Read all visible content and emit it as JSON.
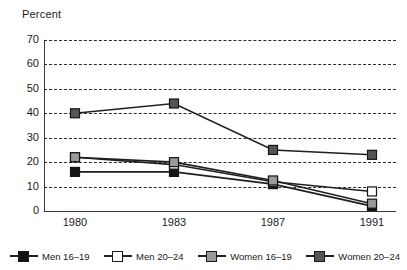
{
  "chart_data": {
    "type": "line",
    "title": "",
    "subtitle": "",
    "xlabel": "",
    "ylabel": "Percent",
    "categories": [
      "1980",
      "1983",
      "1987",
      "1991"
    ],
    "ylim": [
      0,
      70
    ],
    "ytick_step": 10,
    "yticks": [
      "70",
      "60",
      "50",
      "40",
      "30",
      "20",
      "10",
      "0"
    ],
    "grid": "horizontal-dashed",
    "legend_position": "bottom",
    "series": [
      {
        "name": "Men 16–19",
        "marker": "filled-square",
        "color": "#141414",
        "values": [
          16,
          16,
          11,
          2
        ]
      },
      {
        "name": "Men 20–24",
        "marker": "open-square",
        "color": "#ffffff",
        "values": [
          22,
          19,
          12,
          8
        ]
      },
      {
        "name": "Women 16–19",
        "marker": "filled-square",
        "color": "#9a9a9a",
        "values": [
          22,
          20,
          12.5,
          3
        ]
      },
      {
        "name": "Women 20–24",
        "marker": "filled-square",
        "color": "#555555",
        "values": [
          40,
          44,
          25,
          23
        ]
      }
    ]
  },
  "axis": {
    "y_label": "Percent",
    "y_ticks": [
      "70",
      "60",
      "50",
      "40",
      "30",
      "20",
      "10",
      "0"
    ],
    "x_ticks": [
      "1980",
      "1983",
      "1987",
      "1991"
    ]
  },
  "legend": {
    "items": [
      {
        "label": "Men 16–19",
        "swatch": "#141414",
        "marker": "filled-square"
      },
      {
        "label": "Men 20–24",
        "swatch": "#ffffff",
        "marker": "open-square"
      },
      {
        "label": "Women 16–19",
        "swatch": "#9a9a9a",
        "marker": "filled-square"
      },
      {
        "label": "Women 20–24",
        "swatch": "#555555",
        "marker": "filled-square"
      }
    ]
  },
  "colors": {
    "line": "#1f1f1f",
    "grid": "#2b2b2b",
    "axis": "#3a3a3a",
    "text": "#1a1a1a"
  }
}
